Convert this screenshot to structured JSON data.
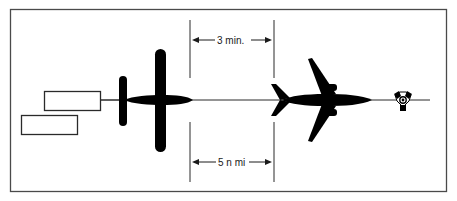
{
  "diagram": {
    "colors": {
      "background": "#ffffff",
      "frame": "#4a4a4a",
      "silhouette": "#000000",
      "line": "#2a2a2a"
    },
    "time_separation": {
      "label": "3 min."
    },
    "distance_separation": {
      "label": "5 n mi"
    },
    "elements": {
      "trailing_aircraft": "light twin/single-engine aircraft silhouette with banner",
      "leading_aircraft": "jet airliner silhouette",
      "navaid": "VOR/DME symbol",
      "banners": 2
    }
  }
}
